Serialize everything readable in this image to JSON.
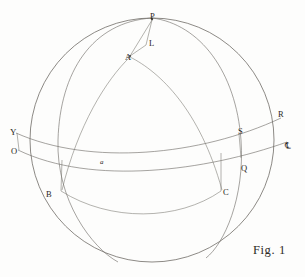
{
  "figure": {
    "caption": "Fig. 1",
    "background_color": "#fdfdfc",
    "ink_color": "#5b5852",
    "width": 305,
    "height": 277
  },
  "labels": [
    {
      "id": "P",
      "text": "P",
      "x": 150,
      "y": 12,
      "style": "plain",
      "role": "north-celestial-pole"
    },
    {
      "id": "L",
      "text": "L",
      "x": 149,
      "y": 39,
      "style": "plain",
      "role": "point-on-hour-circle"
    },
    {
      "id": "A",
      "text": "A",
      "x": 125,
      "y": 53,
      "style": "plain",
      "role": "vertex-a"
    },
    {
      "id": "U",
      "text": "Υ",
      "x": 10,
      "y": 128,
      "style": "symbol",
      "role": "vernal-equinox-aries"
    },
    {
      "id": "O",
      "text": "O",
      "x": 11,
      "y": 147,
      "style": "plain",
      "role": "origin-point-o"
    },
    {
      "id": "a",
      "text": "a",
      "x": 100,
      "y": 159,
      "style": "italic",
      "role": "point-lowercase-a"
    },
    {
      "id": "R",
      "text": "R",
      "x": 278,
      "y": 110,
      "style": "plain",
      "role": "point-r"
    },
    {
      "id": "S",
      "text": "S",
      "x": 238,
      "y": 127,
      "style": "plain",
      "role": "point-s"
    },
    {
      "id": "Lib",
      "text": "℄",
      "x": 285,
      "y": 142,
      "style": "symbol",
      "role": "autumnal-equinox-libra"
    },
    {
      "id": "Q",
      "text": "Q",
      "x": 241,
      "y": 164,
      "style": "plain",
      "role": "point-q"
    },
    {
      "id": "B",
      "text": "B",
      "x": 46,
      "y": 190,
      "style": "plain",
      "role": "point-b"
    },
    {
      "id": "C",
      "text": "C",
      "x": 223,
      "y": 188,
      "style": "plain",
      "role": "point-c"
    }
  ],
  "geometry": {
    "sphere_outline": {
      "name": "celestial-sphere-outline",
      "cx": 152,
      "cy": 140,
      "r": 122
    },
    "arcs": [
      {
        "name": "meridian-left-limb",
        "d": "M 152,18 C 92,22 60,72 58,140 C 56,200 92,248 118,262"
      },
      {
        "name": "meridian-through-pq",
        "d": "M 152,18 C 200,24 236,72 241,140 C 245,198 224,244 206,258"
      },
      {
        "name": "hour-circle-a-c",
        "d": "M 130,57 C 160,72 200,110 222,190"
      },
      {
        "name": "hour-circle-a-b",
        "d": "M 130,57 C 106,80 78,125 62,190"
      },
      {
        "name": "ecliptic",
        "d": "M 16,133 C 90,166 200,156 281,118"
      },
      {
        "name": "celestial-equator",
        "d": "M 18,150 C 92,186 206,171 287,142"
      },
      {
        "name": "lower-parallel-bc",
        "d": "M 61,191 C 110,222 178,221 221,191"
      }
    ],
    "chords": [
      {
        "name": "chord-p-a",
        "x1": 152,
        "y1": 20,
        "x2": 130,
        "y2": 56
      },
      {
        "name": "chord-p-l",
        "x1": 152,
        "y1": 20,
        "x2": 146,
        "y2": 45
      },
      {
        "name": "chord-a-l",
        "x1": 130,
        "y1": 56,
        "x2": 146,
        "y2": 45
      },
      {
        "name": "radius-u-o",
        "x1": 17,
        "y1": 133,
        "x2": 19,
        "y2": 150
      },
      {
        "name": "radius-s-q",
        "x1": 239,
        "y1": 134,
        "x2": 241,
        "y2": 158
      },
      {
        "name": "radius-b",
        "x1": 62,
        "y1": 160,
        "x2": 61,
        "y2": 191
      },
      {
        "name": "radius-c",
        "x1": 221,
        "y1": 153,
        "x2": 221,
        "y2": 191
      }
    ],
    "nodes": [
      {
        "name": "node-p",
        "cx": 152,
        "cy": 19
      },
      {
        "name": "node-a",
        "cx": 130,
        "cy": 56
      }
    ]
  }
}
